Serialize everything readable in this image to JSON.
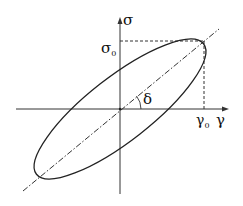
{
  "diagram": {
    "type": "hysteresis-ellipse",
    "axes": {
      "x_label": "γ",
      "y_label": "σ"
    },
    "labels": {
      "stress_amplitude": {
        "base": "σ",
        "sub": "0"
      },
      "strain_amplitude": {
        "base": "γ",
        "sub": "0"
      },
      "phase_angle": "δ"
    },
    "colors": {
      "line": "#222222",
      "background": "#ffffff"
    }
  }
}
